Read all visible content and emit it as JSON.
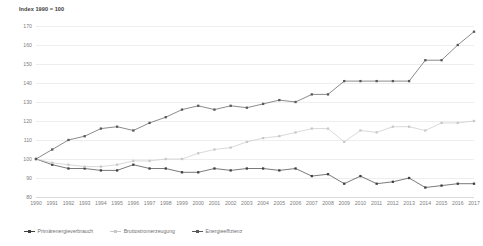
{
  "axis_title": "Index 1990 = 100",
  "legend": {
    "items": [
      {
        "label": "Primärenergieverbrauch",
        "color": "#404040",
        "marker": "square"
      },
      {
        "label": "Bruttostromerzeugung",
        "color": "#c9c9c9",
        "marker": "square"
      },
      {
        "label": "Energieeffizienz",
        "color": "#595959",
        "marker": "square"
      }
    ]
  },
  "chart_data": {
    "type": "line",
    "title": "Index 1990 = 100",
    "xlabel": "",
    "ylabel": "Index 1990 = 100",
    "ylim": [
      80,
      170
    ],
    "yticks": [
      80,
      90,
      100,
      110,
      120,
      130,
      140,
      150,
      160,
      170
    ],
    "grid": true,
    "legend_position": "bottom-left",
    "categories": [
      "1990",
      "1991",
      "1992",
      "1993",
      "1994",
      "1995",
      "1996",
      "1997",
      "1998",
      "1999",
      "2000",
      "2001",
      "2002",
      "2003",
      "2004",
      "2005",
      "2006",
      "2007",
      "2008",
      "2009",
      "2010",
      "2011",
      "2012",
      "2013",
      "2014",
      "2015",
      "2016",
      "2017"
    ],
    "series": [
      {
        "name": "Primärenergieverbrauch",
        "color": "#404040",
        "values": [
          100,
          97,
          95,
          95,
          94,
          94,
          97,
          95,
          95,
          93,
          93,
          95,
          94,
          95,
          95,
          94,
          95,
          91,
          92,
          87,
          91,
          87,
          88,
          90,
          85,
          86,
          87,
          87
        ]
      },
      {
        "name": "Bruttostromerzeugung",
        "color": "#c9c9c9",
        "values": [
          100,
          98,
          97,
          96,
          96,
          97,
          99,
          99,
          100,
          100,
          103,
          105,
          106,
          109,
          111,
          112,
          114,
          116,
          116,
          109,
          115,
          114,
          117,
          117,
          115,
          119,
          119,
          120
        ]
      },
      {
        "name": "Energieeffizienz",
        "color": "#595959",
        "values": [
          100,
          105,
          110,
          112,
          116,
          117,
          115,
          119,
          122,
          126,
          128,
          126,
          128,
          127,
          129,
          131,
          130,
          134,
          134,
          141,
          141,
          141,
          141,
          141,
          152,
          152,
          160,
          167
        ]
      }
    ]
  }
}
